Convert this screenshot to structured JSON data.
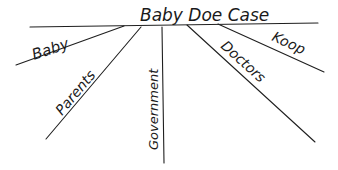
{
  "diagram": {
    "type": "tree-diagram",
    "title": "Baby Doe Case",
    "branches": [
      {
        "label": "Baby"
      },
      {
        "label": "Parents"
      },
      {
        "label": "Government"
      },
      {
        "label": "Doctors"
      },
      {
        "label": "Koop"
      }
    ]
  },
  "colors": {
    "ink": "#1f1f1f",
    "background": "#ffffff"
  }
}
